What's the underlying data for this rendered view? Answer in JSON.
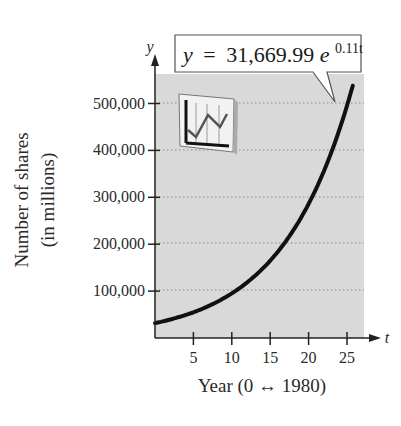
{
  "chart_data": {
    "type": "line",
    "title": "",
    "equation": {
      "lhs": "y",
      "equals": "=",
      "coefficient": "31,669.99",
      "base": "e",
      "exponent": "0.11t"
    },
    "xlabel": "Year (0 ↔ 1980)",
    "ylabel_line1": "Number of shares",
    "ylabel_line2": "(in millions)",
    "x_axis_var": "t",
    "y_axis_var": "y",
    "xlim": [
      0,
      27
    ],
    "ylim": [
      0,
      560000
    ],
    "x_ticks": [
      5,
      10,
      15,
      20,
      25
    ],
    "x_tick_labels": [
      "5",
      "10",
      "15",
      "20",
      "25"
    ],
    "y_ticks": [
      100000,
      200000,
      300000,
      400000,
      500000
    ],
    "y_tick_labels": [
      "100,000",
      "200,000",
      "300,000",
      "400,000",
      "500,000"
    ],
    "grid": "horizontal dotted",
    "legend": "none",
    "series": [
      {
        "name": "y = 31,669.99e^(0.11t)",
        "model": "31669.99*exp(0.11*t)",
        "x": [
          0,
          5,
          10,
          15,
          20,
          25,
          25.6
        ],
        "values": [
          31670,
          54875,
          95095,
          164780,
          285540,
          494795,
          552000
        ]
      }
    ],
    "colors": {
      "plot_background": "#d9d9d9",
      "curve": "#111111",
      "gridline": "#8a8a8a",
      "axis": "#222222"
    }
  }
}
